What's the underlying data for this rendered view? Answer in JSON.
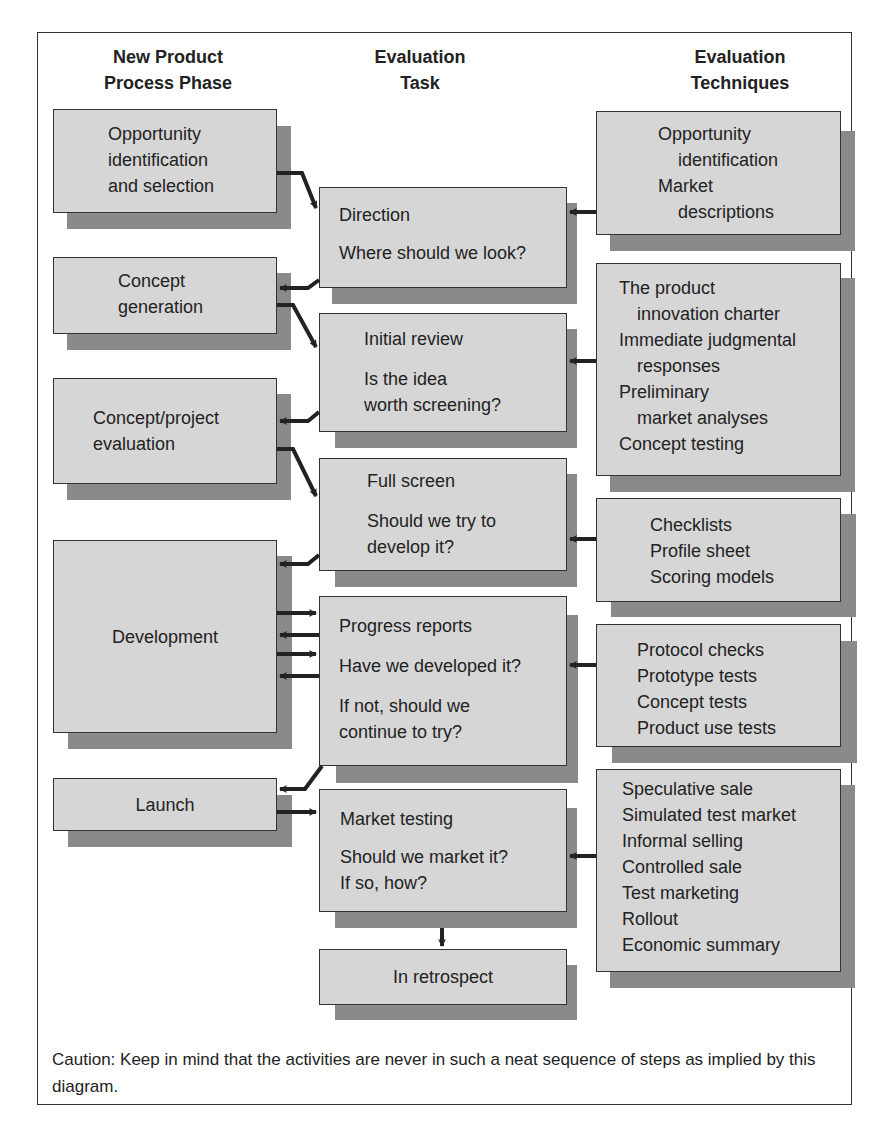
{
  "headers": {
    "phase": [
      "New Product",
      "Process Phase"
    ],
    "task": [
      "Evaluation",
      "Task"
    ],
    "techniques": [
      "Evaluation",
      "Techniques"
    ]
  },
  "phases": [
    {
      "lines": [
        "Opportunity",
        "identification",
        "and selection"
      ]
    },
    {
      "lines": [
        "Concept",
        "generation"
      ]
    },
    {
      "lines": [
        "Concept/project",
        "evaluation"
      ]
    },
    {
      "lines": [
        "Development"
      ]
    },
    {
      "lines": [
        "Launch"
      ]
    }
  ],
  "tasks": [
    {
      "title": "Direction",
      "lines": [
        "Where should we look?"
      ]
    },
    {
      "title": "Initial review",
      "lines": [
        "Is the idea",
        "worth screening?"
      ]
    },
    {
      "title": "Full screen",
      "lines": [
        "Should we try to",
        "develop it?"
      ]
    },
    {
      "title": "Progress reports",
      "lines": [
        "Have we developed it?"
      ],
      "extra": [
        "If not, should we",
        "continue to try?"
      ]
    },
    {
      "title": "Market testing",
      "lines": [
        "Should we market it?",
        "If so, how?"
      ]
    },
    {
      "title": "In retrospect",
      "lines": []
    }
  ],
  "techniques": [
    {
      "lines": [
        "Opportunity",
        "  identification",
        "Market",
        "  descriptions"
      ]
    },
    {
      "lines": [
        "The product",
        "  innovation charter",
        "Immediate judgmental",
        "  responses",
        "Preliminary",
        "  market analyses",
        "Concept testing"
      ]
    },
    {
      "lines": [
        "Checklists",
        "Profile sheet",
        "Scoring models"
      ]
    },
    {
      "lines": [
        "Protocol checks",
        "Prototype tests",
        "Concept tests",
        "Product use tests"
      ]
    },
    {
      "lines": [
        "Speculative sale",
        "Simulated test market",
        "Informal selling",
        "Controlled sale",
        "Test marketing",
        "Rollout",
        "Economic summary"
      ]
    }
  ],
  "caption": "Caution: Keep in mind that the activities are never in such a neat sequence of steps as implied by this diagram.",
  "colors": {
    "box_fill": "#d6d6d6",
    "box_shadow": "#8a8a8a",
    "border": "#333333",
    "arrow": "#222222"
  }
}
